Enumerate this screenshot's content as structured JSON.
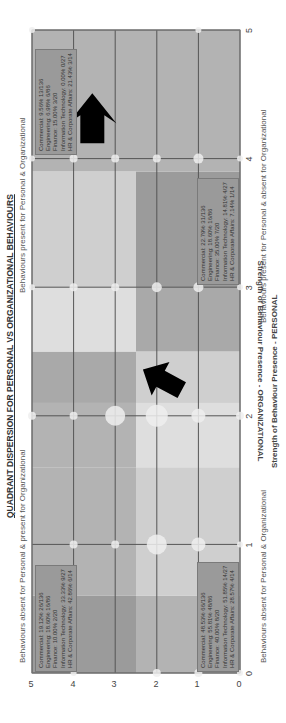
{
  "chart_data": {
    "type": "scatter",
    "title": "QUADRANT DISPERSION FOR PERSONAL VS ORGANIZATIONAL BEHAVIOURS",
    "xlabel": "Strength of Behaviour Presence - PERSONAL",
    "ylabel": "Strength of Behaviour Presence - ORGANIZATIONAL",
    "xlim": [
      0,
      5
    ],
    "ylim": [
      0,
      5
    ],
    "x_ticks": [
      "0",
      "1",
      "2",
      "3",
      "4",
      "5"
    ],
    "y_ticks": [
      "0",
      "1",
      "2",
      "3",
      "4",
      "5"
    ],
    "grid": true,
    "rotation": "chart rendered rotated 90 degrees counter-clockwise",
    "quadrant_labels": {
      "top_left": "Behaviours absent for Personal & present for Organizational",
      "top_right": "Behaviours present for Personal & Organizational",
      "bottom_left": "Behaviours absent for Personal & Organizational",
      "bottom_right": "Behaviours present for Personal & absent for Organizational"
    },
    "quadrant_stats": {
      "top_left": [
        "Commercial: 19.12% 26/136",
        "Engineering: 18.60% 16/86",
        "Finance: 10.00% 2/20",
        "Information Technology: 33.33% 9/27",
        "HR & Corporate Affairs: 42.86% 6/14"
      ],
      "top_right": [
        "Commercial: 9.56% 13/136",
        "Engineering: 6.98% 6/86",
        "Finance: 15.00% 3/20",
        "Information Technology: 0.00% 0/27",
        "HR & Corporate Affairs: 21.43% 3/14"
      ],
      "bottom_left": [
        "Commercial: 48.53% 66/136",
        "Engineering: 55.81% 48/86",
        "Finance: 40.00% 8/20",
        "Information Technology: 51.85% 14/27",
        "HR & Corporate Affairs: 28.57% 4/14"
      ],
      "bottom_right": [
        "Commercial: 22.79% 31/136",
        "Engineering: 18.60% 16/86",
        "Finance: 35.00% 7/20",
        "Information Technology: 14.81% 4/27",
        "HR & Corporate Affairs: 7.14% 1/14"
      ]
    },
    "bubbles": [
      {
        "x": 0,
        "y": 0,
        "size": 3
      },
      {
        "x": 0,
        "y": 1,
        "size": 4
      },
      {
        "x": 0,
        "y": 2,
        "size": 4
      },
      {
        "x": 0,
        "y": 4,
        "size": 3
      },
      {
        "x": 1,
        "y": 0,
        "size": 3
      },
      {
        "x": 1,
        "y": 1,
        "size": 7
      },
      {
        "x": 1,
        "y": 2,
        "size": 10
      },
      {
        "x": 1,
        "y": 3,
        "size": 4
      },
      {
        "x": 1,
        "y": 4,
        "size": 4
      },
      {
        "x": 2,
        "y": 0,
        "size": 4
      },
      {
        "x": 2,
        "y": 1,
        "size": 7
      },
      {
        "x": 2,
        "y": 2,
        "size": 11
      },
      {
        "x": 2,
        "y": 3,
        "size": 10
      },
      {
        "x": 2,
        "y": 4,
        "size": 4
      },
      {
        "x": 2,
        "y": 5,
        "size": 4
      },
      {
        "x": 3,
        "y": 0,
        "size": 3
      },
      {
        "x": 3,
        "y": 1,
        "size": 5
      },
      {
        "x": 3,
        "y": 2,
        "size": 5
      },
      {
        "x": 3,
        "y": 3,
        "size": 4
      },
      {
        "x": 3,
        "y": 4,
        "size": 4
      },
      {
        "x": 3,
        "y": 5,
        "size": 3
      },
      {
        "x": 4,
        "y": 0,
        "size": 3
      },
      {
        "x": 4,
        "y": 1,
        "size": 5
      },
      {
        "x": 4,
        "y": 2,
        "size": 4
      },
      {
        "x": 4,
        "y": 3,
        "size": 4
      },
      {
        "x": 4,
        "y": 4,
        "size": 4
      },
      {
        "x": 4,
        "y": 5,
        "size": 3
      },
      {
        "x": 5,
        "y": 1,
        "size": 3
      },
      {
        "x": 5,
        "y": 5,
        "size": 3
      }
    ],
    "arrows": [
      {
        "from": [
          2.4,
          1.9
        ],
        "to": [
          2.9,
          2.8
        ],
        "description": "arrow pointing up-right from origin region toward center"
      },
      {
        "from": [
          4.2,
          3.3
        ],
        "to": [
          4.6,
          3.3
        ],
        "description": "arrow pointing right in top-right quadrant"
      }
    ],
    "colors": {
      "dark_band": "#9b9b9b",
      "mid_band": "#b3b3b3",
      "light_band": "#cfcfcf",
      "lightest_band": "#dedede",
      "grid_line": "#555555",
      "bubble": "#efefef",
      "arrow": "#000000"
    }
  }
}
